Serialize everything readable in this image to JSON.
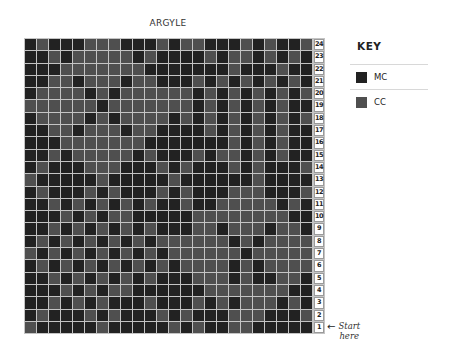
{
  "chart": {
    "title": "ARGYLE",
    "start_label_line1": "Start",
    "start_label_line2": "here",
    "arrow_icon": "left-arrow"
  },
  "key": {
    "title": "KEY",
    "items": [
      {
        "label": "MC",
        "code": "D",
        "color": "#222222"
      },
      {
        "label": "CC",
        "code": "L",
        "color": "#4f4f4f"
      }
    ]
  },
  "colors": {
    "grid_line": "#c4c4c4",
    "mc": "#222222",
    "cc": "#4f4f4f"
  },
  "chart_data": {
    "type": "heatmap",
    "title": "ARGYLE",
    "columns": 24,
    "rows": 24,
    "row_labels_top_to_bottom": [
      24,
      23,
      22,
      21,
      20,
      19,
      18,
      17,
      16,
      15,
      14,
      13,
      12,
      11,
      10,
      9,
      8,
      7,
      6,
      5,
      4,
      3,
      2,
      1
    ],
    "legend": {
      "D": "MC",
      "L": "CC"
    },
    "annotation": "Start here (row 1)",
    "grid_top_to_bottom": [
      "DLDDDLLLDDDLDLLDDDLDLDDL",
      "DDLDLLLLLDLDDDDLDLLDLDLD",
      "DDDLLLLLLLDDDDDDDLDDDLDD",
      "DDLLDLLLDLLDDDLDLDLDLDLD",
      "DLLLLDLDLLLLLLDLDLDLDLDL",
      "LLLLLLDLLLLLLLDLDLDLDLDD",
      "DLLLLDLDLLLLDLDLDLDLDLDL",
      "DDLLDLLLDLLDDDDLDLDLDLDD",
      "DDDLLLLLLLDDDDDDDLDLDLDD",
      "DDLDLLLLLDLDDDLDLLDLDLDD",
      "DLDDDLLLDDDLDLDDDLDLDDDL",
      "LDDDDDLDDDDDLDDDDDDLDDDD",
      "DLDDDLDLDDDLDLDDDLLLDDDL",
      "DDLDLDLDLDLDDLDDLLLLLDLD",
      "DDDLDLDLLDDDDDLLLLLLLLDD",
      "DDLDLDLDLDLDDDLLDLLLDLLD",
      "DLDLDLDLDLDLLLLLLDLDLLLL",
      "LDLDLDLDLDLDLLLLLLDLLLLL",
      "DLDLDLDLDLDLDLLLLDLDLLLL",
      "DDLDLDLDLDLDDDLLLDLDDLLD",
      "DDDLDLDLLDDDDDDLLLLLLLDD",
      "DDLDLDLDDDLDDDLDLDLLLDLD",
      "DLDDDLDLDDDLDLDDDLLLDDDL",
      "LDDDDDLDDDDDLDLDDLLDDDDD"
    ]
  }
}
